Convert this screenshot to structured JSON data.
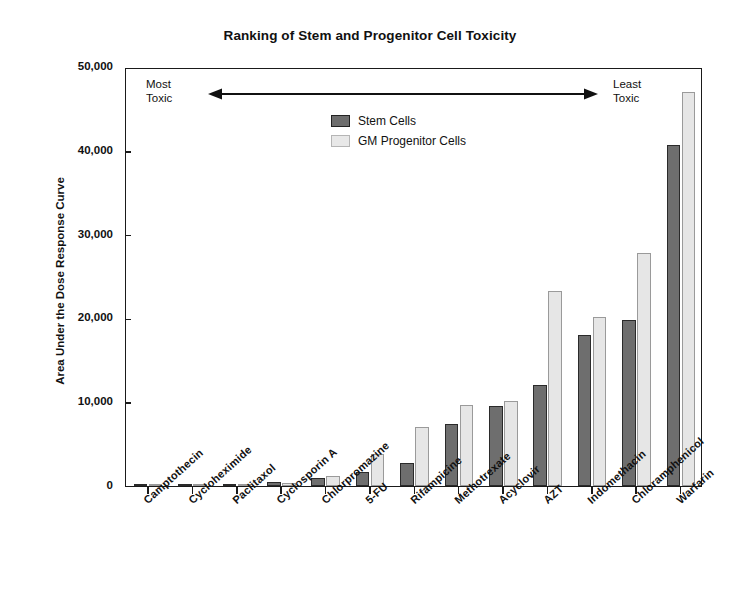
{
  "chart_data": {
    "type": "bar",
    "title": "Ranking of Stem and Progenitor Cell Toxicity",
    "xlabel": "",
    "ylabel": "Area Under the Dose Response Curve",
    "ylim": [
      0,
      50000
    ],
    "yticks": [
      0,
      10000,
      20000,
      30000,
      40000,
      50000
    ],
    "ytick_labels": [
      "0",
      "10,000",
      "20,000",
      "30,000",
      "40,000",
      "50,000"
    ],
    "grid": false,
    "legend_position": "upper-center-left",
    "categories": [
      "Camptothecin",
      "Cycloheximide",
      "Paclitaxol",
      "Cyclosporin A",
      "Chlorpromazine",
      "5-FU",
      "Rifampicine",
      "Methotrexate",
      "Acyclovir",
      "AZT",
      "Indomethacin",
      "Chloramphenicol",
      "Warfarin"
    ],
    "series": [
      {
        "name": "Stem Cells",
        "color": "#6e6e6e",
        "values": [
          60,
          80,
          200,
          450,
          900,
          1700,
          2800,
          7400,
          9600,
          12100,
          18000,
          19800,
          40700
        ]
      },
      {
        "name": "GM Progenitor Cells",
        "color": "#e6e6e6",
        "values": [
          50,
          70,
          250,
          400,
          1150,
          3850,
          7000,
          9700,
          10200,
          23300,
          20200,
          27800,
          47000
        ]
      }
    ],
    "annotations": [
      {
        "id": "most-toxic",
        "text_line1": "Most",
        "text_line2": "Toxic"
      },
      {
        "id": "least-toxic",
        "text_line1": "Least",
        "text_line2": "Toxic"
      }
    ]
  },
  "legend": {
    "items": [
      {
        "label": "Stem Cells",
        "swatch": "stem"
      },
      {
        "label": "GM Progenitor Cells",
        "swatch": "prog"
      }
    ]
  }
}
